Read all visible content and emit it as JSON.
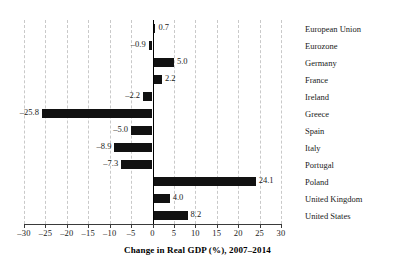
{
  "chart_data": {
    "type": "bar",
    "orientation": "horizontal",
    "title": "",
    "xlabel": "Change in Real GDP (%), 2007–2014",
    "ylabel": "",
    "xlim": [
      -30,
      30
    ],
    "xticks": [
      -30,
      -25,
      -20,
      -15,
      -10,
      -5,
      0,
      5,
      10,
      15,
      20,
      25,
      30
    ],
    "xtick_labels": [
      "–30",
      "–25",
      "–20",
      "–15",
      "–10",
      "–5",
      "0",
      "5",
      "10",
      "15",
      "20",
      "25",
      "30"
    ],
    "grid": true,
    "grid_style": "dashed vertical",
    "legend": null,
    "bar_color": "#111111",
    "categories": [
      "European Union",
      "Eurozone",
      "Germany",
      "France",
      "Ireland",
      "Greece",
      "Spain",
      "Italy",
      "Portugal",
      "Poland",
      "United Kingdom",
      "United States"
    ],
    "values": [
      0.7,
      -0.9,
      5.0,
      2.2,
      -2.2,
      -25.8,
      -5.0,
      -8.9,
      -7.3,
      24.1,
      4.0,
      8.2
    ],
    "data_labels": [
      "0.7",
      "–0.9",
      "5.0",
      "2.2",
      "–2.2",
      "–25.8",
      "–5.0",
      "–8.9",
      "–7.3",
      "24.1",
      "4.0",
      "8.2"
    ]
  }
}
